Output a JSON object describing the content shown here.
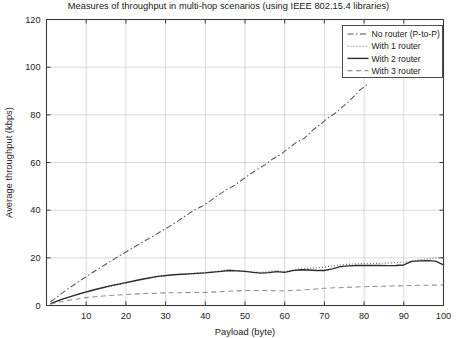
{
  "chart_data": {
    "type": "line",
    "title": "Measures of throughput in multi-hop scenarios (using IEEE 802.15.4 libraries)",
    "xlabel": "Payload (byte)",
    "ylabel": "Average throughput (kbps)",
    "xlim": [
      0,
      100
    ],
    "ylim": [
      0,
      120
    ],
    "xticks": [
      10,
      20,
      30,
      40,
      50,
      60,
      70,
      80,
      90,
      100
    ],
    "xtick_labels": [
      "10",
      "20",
      "30",
      "40",
      "50",
      "60",
      "70",
      "80",
      "90",
      "100"
    ],
    "yticks": [
      0,
      20,
      40,
      60,
      80,
      100,
      120
    ],
    "ytick_labels": [
      "0",
      "20",
      "40",
      "60",
      "80",
      "100",
      "120"
    ],
    "grid": true,
    "legend_position": "upper right",
    "series": [
      {
        "name": "No router (P-to-P)",
        "style": "dashdot",
        "color": "#555555",
        "x": [
          1,
          3,
          5,
          7,
          9,
          11,
          13,
          15,
          17,
          19,
          21,
          23,
          25,
          27,
          29,
          31,
          33,
          35,
          37,
          39,
          41,
          43,
          45,
          47,
          49,
          51,
          53,
          55,
          57,
          59,
          61,
          63,
          65,
          67,
          69,
          71,
          73,
          75,
          77,
          79,
          81
        ],
        "y": [
          1.5,
          4.0,
          6.5,
          8.8,
          11.0,
          13.2,
          15.3,
          17.4,
          19.4,
          21.5,
          23.4,
          25.4,
          27.4,
          29.2,
          31.3,
          33.2,
          35.3,
          37.6,
          39.8,
          41.5,
          43.6,
          46.0,
          48.2,
          50.0,
          52.4,
          54.8,
          57.0,
          59.0,
          61.5,
          63.4,
          66.0,
          68.5,
          70.2,
          73.5,
          76.0,
          78.8,
          81.0,
          84.0,
          87.0,
          90.5,
          93.0
        ]
      },
      {
        "name": "With 1 router",
        "style": "dotted",
        "color": "#6a6a6a",
        "x": [
          1,
          4,
          8,
          12,
          16,
          20,
          24,
          28,
          32,
          36,
          40,
          44,
          46,
          48,
          50,
          52,
          54,
          56,
          58,
          60,
          62,
          64,
          66,
          68,
          70,
          72,
          74,
          76,
          78,
          80,
          82,
          84,
          86,
          88,
          90,
          92,
          94,
          96,
          98,
          100
        ],
        "y": [
          0.8,
          2.6,
          4.6,
          6.4,
          8.0,
          9.4,
          10.8,
          12.1,
          12.9,
          13.4,
          13.9,
          14.6,
          15.0,
          14.6,
          14.4,
          14.2,
          13.9,
          14.3,
          14.6,
          14.2,
          14.8,
          15.4,
          15.6,
          15.8,
          16.1,
          16.6,
          17.0,
          17.3,
          17.5,
          17.6,
          17.6,
          17.7,
          17.8,
          18.0,
          18.2,
          18.6,
          19.2,
          19.6,
          19.9,
          20.1
        ]
      },
      {
        "name": "With 2 router",
        "style": "solid",
        "color": "#2b2b2b",
        "x": [
          1,
          4,
          8,
          12,
          16,
          20,
          24,
          28,
          32,
          36,
          40,
          44,
          46,
          48,
          50,
          52,
          54,
          56,
          58,
          60,
          62,
          64,
          66,
          68,
          70,
          72,
          74,
          76,
          78,
          80,
          82,
          84,
          86,
          88,
          90,
          92,
          94,
          96,
          98,
          100
        ],
        "y": [
          0.8,
          2.7,
          4.8,
          6.6,
          8.2,
          9.6,
          11.0,
          12.2,
          12.9,
          13.3,
          13.7,
          14.3,
          14.7,
          14.5,
          14.3,
          13.9,
          13.6,
          13.8,
          14.2,
          13.9,
          14.6,
          15.0,
          14.9,
          14.7,
          14.7,
          15.4,
          16.3,
          16.6,
          16.8,
          16.8,
          16.8,
          16.8,
          16.7,
          16.8,
          17.0,
          18.5,
          18.7,
          18.8,
          18.6,
          17.0
        ]
      },
      {
        "name": "With 3 router",
        "style": "dashed",
        "color": "#8e8e8e",
        "x": [
          1,
          5,
          10,
          15,
          20,
          25,
          30,
          35,
          40,
          45,
          50,
          55,
          60,
          65,
          70,
          75,
          80,
          85,
          90,
          95,
          100
        ],
        "y": [
          0.6,
          2.0,
          3.3,
          4.1,
          4.6,
          5.0,
          5.3,
          5.4,
          5.5,
          5.9,
          6.3,
          6.3,
          6.1,
          6.6,
          7.2,
          7.6,
          7.9,
          8.1,
          8.3,
          8.5,
          8.6
        ]
      }
    ]
  }
}
